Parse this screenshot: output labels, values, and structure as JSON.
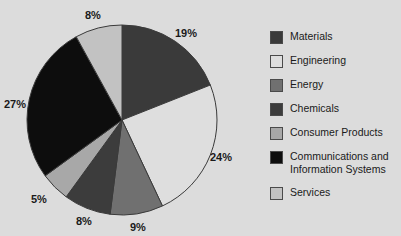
{
  "background_color": "#dcdcdc",
  "chart_data": {
    "type": "pie",
    "title": "",
    "legend_position": "right",
    "start_angle_deg": 0,
    "direction": "clockwise",
    "categories": [
      "Materials",
      "Engineering",
      "Energy",
      "Chemicals",
      "Consumer Products",
      "Communications and Information Systems",
      "Services"
    ],
    "values": [
      19,
      24,
      9,
      8,
      5,
      27,
      8
    ],
    "value_labels": [
      "19%",
      "24%",
      "9%",
      "8%",
      "5%",
      "27%",
      "8%"
    ],
    "colors": [
      "#3a3a3a",
      "#dedede",
      "#707070",
      "#3c3c3c",
      "#a8a8a8",
      "#0d0d0d",
      "#c2c2c2"
    ],
    "slice_border_color": "#3a3a3a",
    "total": 100
  },
  "pie": {
    "center_x": 122,
    "center_y": 120,
    "radius": 95,
    "labels": [
      {
        "text": "19%",
        "x": 175,
        "y": 28
      },
      {
        "text": "24%",
        "x": 210,
        "y": 152
      },
      {
        "text": "9%",
        "x": 130,
        "y": 222
      },
      {
        "text": "8%",
        "x": 76,
        "y": 216
      },
      {
        "text": "5%",
        "x": 31,
        "y": 194
      },
      {
        "text": "27%",
        "x": 4,
        "y": 99
      },
      {
        "text": "8%",
        "x": 85,
        "y": 10
      }
    ]
  },
  "legend": {
    "items": [
      {
        "label": "Materials",
        "color": "#3a3a3a"
      },
      {
        "label": "Engineering",
        "color": "#dedede"
      },
      {
        "label": "Energy",
        "color": "#707070"
      },
      {
        "label": "Chemicals",
        "color": "#3c3c3c"
      },
      {
        "label": "Consumer Products",
        "color": "#a8a8a8"
      },
      {
        "label": "Communications and\nInformation Systems",
        "color": "#0d0d0d"
      },
      {
        "label": "Services",
        "color": "#c2c2c2"
      }
    ]
  }
}
